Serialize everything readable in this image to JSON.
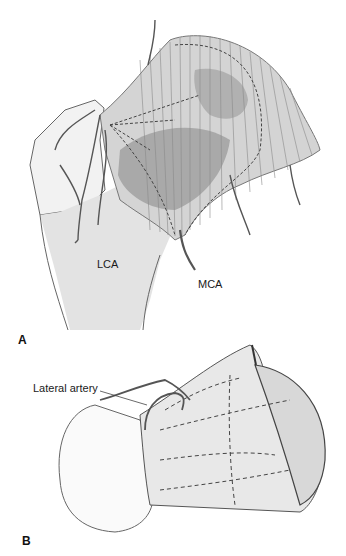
{
  "figure": {
    "panels": [
      {
        "letter": "A",
        "labels": [
          {
            "id": "lca",
            "text": "LCA"
          },
          {
            "id": "mca",
            "text": "MCA"
          }
        ]
      },
      {
        "letter": "B",
        "labels": [
          {
            "id": "lateral_artery",
            "text": "Lateral artery"
          }
        ]
      }
    ]
  },
  "colors": {
    "background": "#ffffff",
    "line": "#555555",
    "shade_light": "#e6e6e6",
    "shade_mid": "#bdbdbd",
    "shade_dark": "#9a9a9a",
    "text": "#1a1a1a"
  }
}
